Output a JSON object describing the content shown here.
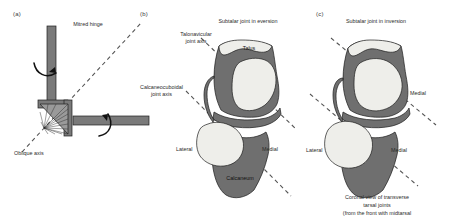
{
  "figure": {
    "panels": [
      {
        "tag": "(a)",
        "labels": {
          "hinge": "Mitred hinge",
          "oblique_axis": "Oblique axis"
        }
      },
      {
        "tag": "(b)",
        "labels": {
          "heading": "Subtalar joint in eversion",
          "talonavicular_axis": "Talonavicular\njoint axis",
          "talonavicular_axis_line1": "Talonavicular",
          "talonavicular_axis_line2": "joint axis",
          "calcaneocuboidal_axis_line1": "Calcaneocuboidal",
          "calcaneocuboidal_axis_line2": "joint axis",
          "talus": "Talus",
          "calcaneum": "Calcaneum",
          "lateral": "Lateral",
          "medial": "Medial"
        }
      },
      {
        "tag": "(c)",
        "labels": {
          "heading": "Subtalar joint in inversion",
          "medial_upper": "Medial",
          "lateral": "Lateral",
          "medial_lower": "Medial",
          "caption_line1": "Coronal view of transverse tarsal joints",
          "caption_line2": "(from the front with midtarsal bones removed)"
        }
      }
    ],
    "colors": {
      "bone_dark": "#6f6f6f",
      "bone_light": "#eeeeea",
      "outline": "#1c1c1c",
      "axis_dash": "#555555",
      "metal": "#7a7a7a",
      "background": "#ffffff"
    }
  }
}
